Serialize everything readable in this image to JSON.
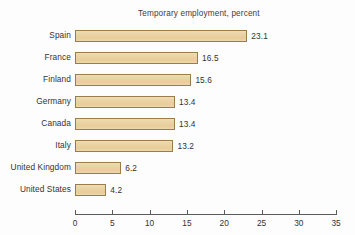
{
  "chart_data": {
    "type": "bar",
    "orientation": "horizontal",
    "title": "Temporary employment, percent",
    "xlabel": "",
    "ylabel": "",
    "categories": [
      "Spain",
      "France",
      "Finland",
      "Germany",
      "Canada",
      "Italy",
      "United Kingdom",
      "United States"
    ],
    "values": [
      23.1,
      16.5,
      15.6,
      13.4,
      13.4,
      13.2,
      6.2,
      4.2
    ],
    "value_labels": [
      "23.1",
      "16.5",
      "15.6",
      "13.4",
      "13.4",
      "13.2",
      "6.2",
      "4.2"
    ],
    "xlim": [
      0,
      35
    ],
    "xticks": [
      0,
      5,
      10,
      15,
      20,
      25,
      30,
      35
    ],
    "xtick_labels": [
      "0",
      "5",
      "10",
      "15",
      "20",
      "25",
      "30",
      "35"
    ],
    "grid": false,
    "legend": null,
    "bar_fill_color": "#ebd3a4",
    "bar_border_color": "#9c7c49",
    "text_color": "#333333",
    "axis_color": "#5a5a5a",
    "background_color": "#fdfdfd"
  }
}
